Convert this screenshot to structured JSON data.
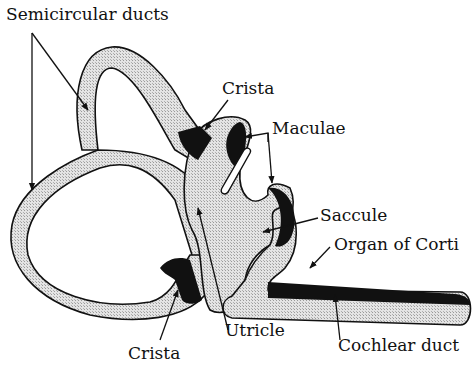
{
  "diagram": {
    "colors": {
      "duct_fill": "#d9d9d9",
      "sensory_fill": "#111111",
      "outline": "#111111",
      "background": "#ffffff"
    },
    "labels": {
      "semicircular_ducts": "Semicircular ducts",
      "crista_top": "Crista",
      "maculae": "Maculae",
      "saccule": "Saccule",
      "organ_of_corti": "Organ of Corti",
      "cochlear_duct": "Cochlear duct",
      "utricle": "Utricle",
      "crista_bottom": "Crista"
    }
  }
}
